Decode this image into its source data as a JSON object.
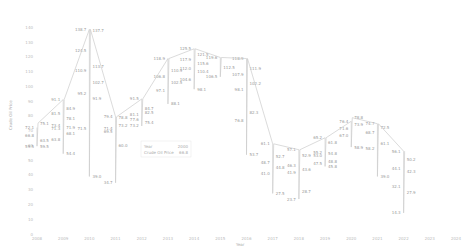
{
  "chart_data": {
    "type": "line",
    "title": "",
    "xlabel": "Year",
    "ylabel": "Crude Oil Price",
    "x_ticks": [
      "2008",
      "2009",
      "2010",
      "2011",
      "2012",
      "2013",
      "2014",
      "2015",
      "2016",
      "2017",
      "2018",
      "2019",
      "2020",
      "2021",
      "2022",
      "2023",
      "2024"
    ],
    "y_ticks": [
      0,
      10,
      20,
      30,
      40,
      50,
      60,
      70,
      80,
      90,
      100,
      110,
      120,
      130,
      140
    ],
    "ylim": [
      0,
      145
    ],
    "grid": false,
    "series": [
      {
        "name": "Crude Oil Price",
        "points": [
          {
            "x": "2008",
            "labels": [
              72.1,
              75.1,
              66.8,
              63.5,
              59.5,
              59.5
            ]
          },
          {
            "x": "2009",
            "labels": [
              91.1,
              84.9,
              81.5,
              78.1,
              73.4,
              71.9,
              71.3,
              68.1,
              63.8,
              54.4
            ]
          },
          {
            "x": "2010",
            "labels": [
              138.7,
              137.7,
              124.5,
              113.7,
              110.9,
              102.7,
              95.2,
              91.9,
              71.5,
              39.0
            ]
          },
          {
            "x": "2011",
            "labels": [
              79.4,
              78.8,
              71.4,
              73.2,
              69.5,
              60.0,
              34.7
            ]
          },
          {
            "x": "2012",
            "labels": [
              91.5,
              84.7,
              81.1,
              82.5,
              77.6,
              75.4,
              73.2
            ]
          },
          {
            "x": "2013",
            "labels": [
              118.9,
              110.9,
              106.8,
              102.5,
              97.1,
              88.1
            ]
          },
          {
            "x": "2014",
            "labels": [
              125.5,
              121.5,
              117.9,
              115.6,
              112.0,
              110.4,
              104.6,
              98.1
            ]
          },
          {
            "x": "2015",
            "labels": [
              119.6,
              112.5,
              106.5
            ]
          },
          {
            "x": "2016",
            "labels": [
              118.9,
              111.9,
              107.9,
              102.2,
              98.1,
              82.3,
              76.8,
              53.7
            ]
          },
          {
            "x": "2017",
            "labels": [
              61.1,
              52.7,
              48.7,
              44.8,
              41.0,
              27.5
            ]
          },
          {
            "x": "2018",
            "labels": [
              57.1,
              52.9,
              46.3,
              43.6,
              41.9,
              28.7,
              23.7
            ]
          },
          {
            "x": "2019",
            "labels": [
              65.2,
              61.8,
              55.2,
              54.8,
              53.0,
              48.8,
              47.5,
              45.8
            ]
          },
          {
            "x": "2020",
            "labels": [
              76.4,
              78.8,
              71.6,
              73.9,
              67.0,
              58.9
            ]
          },
          {
            "x": "2021",
            "labels": [
              74.7,
              72.5,
              68.7,
              61.1,
              58.2,
              39.0
            ]
          },
          {
            "x": "2022",
            "labels": [
              56.1,
              50.2,
              44.1,
              42.3,
              32.1,
              27.9,
              14.3
            ]
          },
          {
            "x": "2023",
            "labels": []
          },
          {
            "x": "2024",
            "labels": []
          }
        ]
      }
    ],
    "tooltip": {
      "rows": [
        {
          "label": "Year",
          "value": "2000"
        },
        {
          "label": "Crude Oil Price",
          "value": "66.8"
        }
      ]
    },
    "legend_position": "none"
  },
  "colors": {
    "line": "#cccccc",
    "text": "#999999",
    "axis": "#bbbbbb"
  }
}
